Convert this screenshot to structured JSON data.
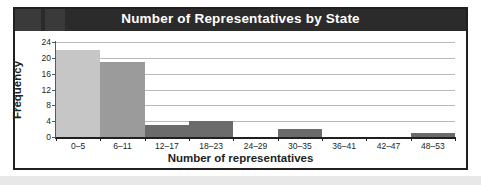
{
  "chart_data": {
    "type": "bar",
    "title": "Number of Representatives by State",
    "xlabel": "Number of representatives",
    "ylabel": "Frequency",
    "categories": [
      "0–5",
      "6–11",
      "12–17",
      "18–23",
      "24–29",
      "30–35",
      "36–41",
      "42–47",
      "48–53"
    ],
    "values": [
      22,
      19,
      3,
      4,
      0,
      2,
      0,
      0,
      1
    ],
    "yticks": [
      0,
      4,
      8,
      12,
      16,
      20,
      24
    ],
    "ytick_labels": [
      "0",
      "4",
      "8",
      "12",
      "16",
      "20",
      "24"
    ],
    "ylim": [
      0,
      24
    ],
    "grid": true,
    "legend": "none",
    "bar_colors": [
      "#c6c6c6",
      "#9b9b9b",
      "#6b6b6b",
      "#6b6b6b",
      "#6b6b6b",
      "#6b6b6b",
      "#6b6b6b",
      "#6b6b6b",
      "#6b6b6b"
    ]
  },
  "style": {
    "title_bar_bg": "#2b2b2b",
    "title_text_color": "#ffffff",
    "frame_border": "#231f20",
    "gridline_color": "#b9b9b9",
    "axis_color": "#231f20",
    "page_bg": "#ffffff",
    "footer_strip": "#e8e8e8"
  }
}
